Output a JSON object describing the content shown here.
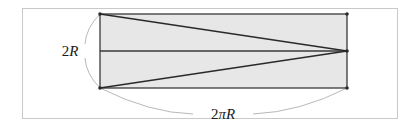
{
  "figure": {
    "name": "unrolled-cylinder-diagram",
    "frame": {
      "stroke": "#c9c9c9",
      "fill": "#ffffff",
      "x": 22,
      "y": 8,
      "width": 376,
      "height": 111
    },
    "rectangle": {
      "name": "unrolled-lateral-surface",
      "fill": "#e7e7e7",
      "stroke": "#3a3a3a",
      "x": 100,
      "y": 14,
      "width": 247,
      "height": 74
    },
    "midline": {
      "name": "horizontal-axis-line",
      "stroke": "#3a3a3a",
      "x1": 100,
      "y1": 51,
      "x2": 347,
      "y2": 51
    },
    "triangle": {
      "name": "inscribed-triangle",
      "stroke": "#2a2a2a",
      "points": "100,14 347,51 100,88"
    },
    "arcs": {
      "height_arc": {
        "name": "height-dimension-arc",
        "stroke": "#b0b0b0",
        "segments": [
          "M 100 14 Q 86 28 85 44",
          "M 85 58 Q 86 74 100 88"
        ]
      },
      "width_arc": {
        "name": "circumference-dimension-arc",
        "stroke": "#b0b0b0",
        "segments": [
          "M 100 88 Q 150 113 193 114",
          "M 253 114 Q 300 112 347 88"
        ]
      }
    },
    "labels": {
      "height": {
        "text": "2R",
        "number": "2",
        "symbol": "R",
        "x": 70,
        "y": 56,
        "font_size": 15
      },
      "width": {
        "text": "2πR",
        "number": "2",
        "symbol": "πR",
        "x": 223,
        "y": 119,
        "font_size": 15
      }
    },
    "vertex_dots": {
      "name": "corner-vertex-markers",
      "fill": "#2a2a2a",
      "radius": 1.8,
      "points": [
        {
          "x": 100,
          "y": 14
        },
        {
          "x": 347,
          "y": 14
        },
        {
          "x": 100,
          "y": 88
        },
        {
          "x": 347,
          "y": 88
        },
        {
          "x": 347,
          "y": 51
        }
      ]
    }
  }
}
